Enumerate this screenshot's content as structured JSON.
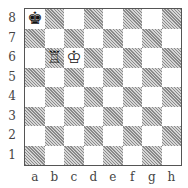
{
  "board": {
    "orientation": "white-bottom",
    "files": [
      "a",
      "b",
      "c",
      "d",
      "e",
      "f",
      "g",
      "h"
    ],
    "ranks": [
      "8",
      "7",
      "6",
      "5",
      "4",
      "3",
      "2",
      "1"
    ],
    "colors": {
      "light": "#ffffff",
      "dark": "#9a9a9a",
      "border": "#555555"
    },
    "pieces": [
      {
        "square": "a8",
        "piece": "king",
        "color": "black",
        "glyph": "♚"
      },
      {
        "square": "b6",
        "piece": "rook",
        "color": "white",
        "glyph": "♖"
      },
      {
        "square": "c6",
        "piece": "king",
        "color": "white",
        "glyph": "♔"
      }
    ]
  }
}
